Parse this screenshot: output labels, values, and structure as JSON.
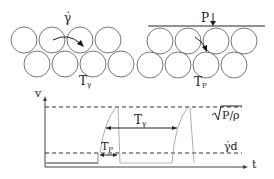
{
  "left_panel": {
    "shear_label": "γ̇",
    "time_label_main": "T",
    "time_label_sub": "γ"
  },
  "right_panel": {
    "pressure_label": "P",
    "time_label_main": "T",
    "time_label_sub": "P"
  },
  "plot": {
    "y_axis_label": "v",
    "x_axis_label": "t",
    "upper_level_label": "P/ρ",
    "lower_level_label": "γ̇d",
    "interval_long_main": "T",
    "interval_long_sub": "γ",
    "interval_short_main": "T",
    "interval_short_sub": "P"
  },
  "colors": {
    "stroke": "#333333",
    "circle": "#666666",
    "faint": "#999999"
  }
}
